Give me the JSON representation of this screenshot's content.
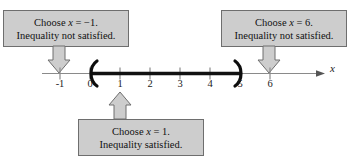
{
  "figure": {
    "type": "number-line-test-interval-diagram",
    "axis_variable_label": "x",
    "number_line": {
      "tick_labels": [
        "-1",
        "0",
        "1",
        "2",
        "3",
        "4",
        "5",
        "6"
      ],
      "tick_values": [
        -1,
        0,
        1,
        2,
        3,
        4,
        5,
        6
      ],
      "axis_min": -1.6,
      "axis_max": 6.9,
      "px_per_unit": 30,
      "origin_px_x": 90,
      "axis_px_y": 73,
      "solution_interval": {
        "left_endpoint": "0",
        "right_endpoint": "5",
        "left_bracket_glyph": "(",
        "right_bracket_glyph": ")",
        "endpoints_included": false,
        "notation": "(0, 5)"
      }
    },
    "callouts": [
      {
        "id": "left",
        "line1_prefix": "Choose ",
        "line1_variable": "x",
        "line1_suffix": " = −1.",
        "line2": "Inequality not satisfied.",
        "points_to_value": "-1",
        "arrow_direction": "down"
      },
      {
        "id": "middle",
        "line1_prefix": "Choose ",
        "line1_variable": "x",
        "line1_suffix": " = 1.",
        "line2": "Inequality satisfied.",
        "points_to_value": "1",
        "arrow_direction": "up"
      },
      {
        "id": "right",
        "line1_prefix": "Choose ",
        "line1_variable": "x",
        "line1_suffix": " = 6.",
        "line2": "Inequality not satisfied.",
        "points_to_value": "6",
        "arrow_direction": "down"
      }
    ],
    "colors": {
      "background": "#ffffff",
      "callout_fill": "#cdcdcd",
      "callout_border": "#6e6e6e",
      "axis_line": "#8a8a8a",
      "interval_line": "#111111",
      "text": "#111111"
    }
  }
}
